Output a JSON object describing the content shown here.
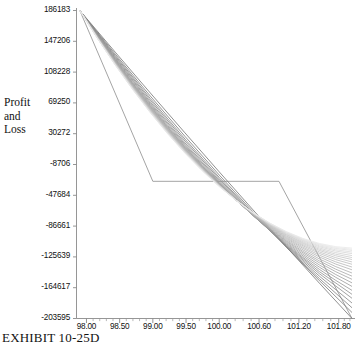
{
  "caption": "EXHIBIT 10-25D",
  "axis_label_y": [
    "Profit",
    "and",
    "Loss"
  ],
  "chart_data": {
    "type": "line",
    "title": "",
    "xlabel": "",
    "ylabel": "Profit and Loss",
    "xlim": [
      97.85,
      102.0
    ],
    "ylim": [
      -203595,
      186183
    ],
    "grid": false,
    "legend": "none",
    "xticks": [
      "98.00",
      "98.50",
      "99.00",
      "99.50",
      "100.00",
      "100.60",
      "101.20",
      "101.80"
    ],
    "xtick_values": [
      98.0,
      98.5,
      99.0,
      99.5,
      100.0,
      100.6,
      101.2,
      101.8
    ],
    "yticks": [
      "186183",
      "147206",
      "108228",
      "69250",
      "30272",
      "-8706",
      "-47684",
      "-86661",
      "-125639",
      "-164617",
      "-203595"
    ],
    "ytick_values": [
      186183,
      147206,
      108228,
      69250,
      30272,
      -8706,
      -47684,
      -86661,
      -125639,
      -164617,
      -203595
    ],
    "series": [
      {
        "name": "expiration-payoff",
        "style": "piecewise-linear",
        "shade": 0.42,
        "x": [
          97.9,
          99.0,
          100.9,
          102.0
        ],
        "y": [
          186183,
          -30000,
          -30000,
          -203595
        ]
      },
      {
        "name": "value-curve-1",
        "shade": 0.55,
        "x": [
          97.9,
          100.0,
          102.0
        ],
        "y": [
          186183,
          -18000,
          -203595
        ]
      },
      {
        "name": "value-curve-2",
        "shade": 0.52,
        "x": [
          97.9,
          100.0,
          102.0
        ],
        "y": [
          186183,
          -22000,
          -196000
        ]
      },
      {
        "name": "value-curve-3",
        "shade": 0.5,
        "x": [
          97.9,
          100.0,
          102.0
        ],
        "y": [
          186183,
          -25000,
          -190000
        ]
      },
      {
        "name": "value-curve-4",
        "shade": 0.48,
        "x": [
          97.9,
          100.0,
          102.0
        ],
        "y": [
          186183,
          -27000,
          -184000
        ]
      },
      {
        "name": "value-curve-5",
        "shade": 0.46,
        "x": [
          97.9,
          100.0,
          102.0
        ],
        "y": [
          186183,
          -29000,
          -178000
        ]
      },
      {
        "name": "value-curve-6",
        "shade": 0.44,
        "x": [
          97.9,
          100.0,
          102.0
        ],
        "y": [
          186183,
          -30500,
          -173000
        ]
      },
      {
        "name": "value-curve-7",
        "shade": 0.42,
        "x": [
          97.9,
          100.0,
          102.0
        ],
        "y": [
          186183,
          -31500,
          -168000
        ]
      },
      {
        "name": "value-curve-8",
        "shade": 0.4,
        "x": [
          97.9,
          100.0,
          102.0
        ],
        "y": [
          186183,
          -32500,
          -163000
        ]
      },
      {
        "name": "value-curve-9",
        "shade": 0.38,
        "x": [
          97.9,
          100.0,
          102.0
        ],
        "y": [
          186183,
          -33000,
          -158500
        ]
      },
      {
        "name": "value-curve-10",
        "shade": 0.36,
        "x": [
          97.9,
          100.0,
          102.0
        ],
        "y": [
          186183,
          -33500,
          -154000
        ]
      },
      {
        "name": "value-curve-11",
        "shade": 0.34,
        "x": [
          97.9,
          100.0,
          102.0
        ],
        "y": [
          186183,
          -34000,
          -150000
        ]
      },
      {
        "name": "value-curve-12",
        "shade": 0.32,
        "x": [
          97.9,
          100.0,
          102.0
        ],
        "y": [
          186183,
          -34200,
          -146000
        ]
      },
      {
        "name": "value-curve-13",
        "shade": 0.3,
        "x": [
          97.9,
          100.0,
          102.0
        ],
        "y": [
          186183,
          -34400,
          -142000
        ]
      },
      {
        "name": "value-curve-14",
        "shade": 0.28,
        "x": [
          97.9,
          100.0,
          102.0
        ],
        "y": [
          186183,
          -34600,
          -138500
        ]
      },
      {
        "name": "value-curve-15",
        "shade": 0.26,
        "x": [
          97.9,
          100.0,
          102.0
        ],
        "y": [
          186183,
          -34800,
          -135000
        ]
      },
      {
        "name": "value-curve-16",
        "shade": 0.24,
        "x": [
          97.9,
          100.0,
          102.0
        ],
        "y": [
          186183,
          -35000,
          -132000
        ]
      },
      {
        "name": "value-curve-17",
        "shade": 0.22,
        "x": [
          97.9,
          100.0,
          102.0
        ],
        "y": [
          186183,
          -35200,
          -129000
        ]
      },
      {
        "name": "value-curve-18",
        "shade": 0.2,
        "x": [
          97.9,
          100.0,
          102.0
        ],
        "y": [
          186183,
          -35400,
          -126500
        ]
      },
      {
        "name": "value-curve-19",
        "shade": 0.18,
        "x": [
          97.9,
          100.0,
          102.0
        ],
        "y": [
          186183,
          -35600,
          -124000
        ]
      },
      {
        "name": "value-curve-20",
        "shade": 0.16,
        "x": [
          97.9,
          100.0,
          102.0
        ],
        "y": [
          186183,
          -35800,
          -121500
        ]
      },
      {
        "name": "value-curve-21",
        "shade": 0.14,
        "x": [
          97.9,
          100.0,
          102.0
        ],
        "y": [
          186183,
          -36000,
          -119500
        ]
      },
      {
        "name": "value-curve-22",
        "shade": 0.12,
        "x": [
          97.9,
          100.0,
          102.0
        ],
        "y": [
          186183,
          -36200,
          -117500
        ]
      },
      {
        "name": "value-curve-23",
        "shade": 0.1,
        "x": [
          97.9,
          100.0,
          102.0
        ],
        "y": [
          186183,
          -36400,
          -116000
        ]
      },
      {
        "name": "value-curve-24",
        "shade": 0.09,
        "x": [
          97.9,
          100.0,
          102.0
        ],
        "y": [
          186183,
          -36600,
          -114500
        ]
      }
    ]
  }
}
